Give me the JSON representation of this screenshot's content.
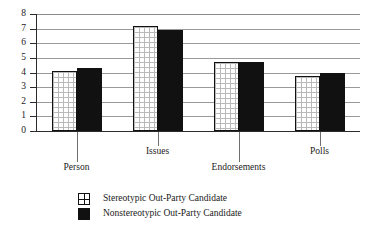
{
  "chart_data": {
    "type": "bar",
    "title": "",
    "subtitle": "",
    "xlabel": "",
    "ylabel": "",
    "ylim": [
      0,
      8
    ],
    "ytick_labels": [
      "8",
      "7",
      "6",
      "5",
      "4",
      "3",
      "2",
      "1",
      "0"
    ],
    "ytick_values": [
      8,
      7,
      6,
      5,
      4,
      3,
      2,
      1,
      0
    ],
    "grid": true,
    "legend_position": "bottom-left",
    "categories": [
      "Person",
      "Issues",
      "Endorsements",
      "Polls"
    ],
    "series": [
      {
        "name": "Stereotypic Out-Party Candidate",
        "fill": "grid-pattern-white",
        "color": "#ffffff",
        "edge_color": "#111111",
        "values": [
          4.1,
          7.15,
          4.7,
          3.75
        ]
      },
      {
        "name": "Nonstereotypic Out-Party Candidate",
        "fill": "solid",
        "color": "#111111",
        "edge_color": "#111111",
        "values": [
          4.3,
          6.9,
          4.75,
          3.95
        ]
      }
    ]
  },
  "legend": {
    "items": [
      {
        "label": "Stereotypic Out-Party Candidate"
      },
      {
        "label": "Nonstereotypic Out-Party Candidate"
      }
    ]
  },
  "colors": {
    "background": "#ffffff",
    "axis": "#2b2b2b",
    "gridline": "#9a9a9a",
    "text": "#1a1a1a",
    "series_light": "#ffffff",
    "series_dark": "#111111"
  }
}
